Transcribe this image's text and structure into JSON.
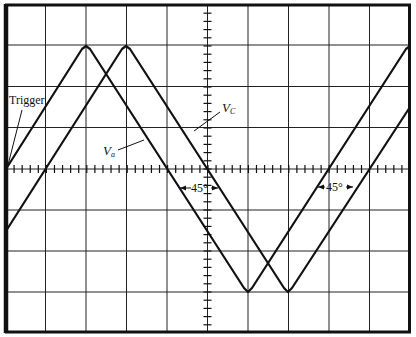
{
  "diagram": {
    "type": "oscilloscope-display",
    "grid": {
      "divisions_x": 10,
      "divisions_y": 8,
      "minor_ticks_per_division": 5
    },
    "labels": {
      "trigger": "Trigger",
      "vc_main": "V",
      "vc_sub": "C",
      "va_main": "V",
      "va_sub": "a",
      "phase_left": "45°",
      "phase_right": "45°"
    },
    "traces": [
      {
        "name": "V_C",
        "shape": "triangle",
        "start_div": 0,
        "phase_deg": 0
      },
      {
        "name": "V_a",
        "shape": "triangle",
        "start_div": 0,
        "phase_deg": -45
      }
    ],
    "colors": {
      "trace": "#111111",
      "grid": "#222222",
      "background": "#ffffff"
    }
  }
}
